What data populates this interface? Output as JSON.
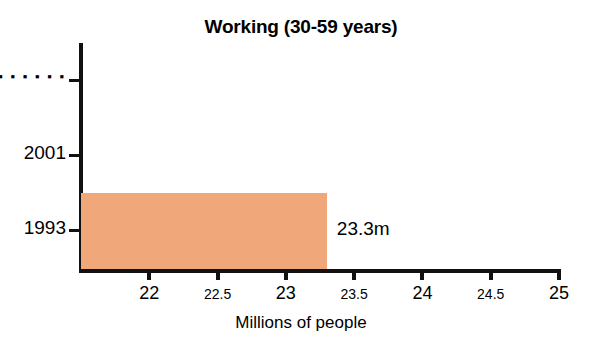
{
  "chart_data": {
    "type": "bar",
    "orientation": "horizontal",
    "title": "Working (30-59 years)",
    "xlabel": "Millions of people",
    "ylabel": "",
    "categories": [
      "1993",
      "2001",
      "……"
    ],
    "values": [
      23.3,
      null,
      null
    ],
    "value_labels": [
      "23.3m",
      "",
      ""
    ],
    "xlim": [
      21.5,
      25
    ],
    "x_axis_start": 21.5,
    "xticks": [
      22,
      22.5,
      23,
      23.5,
      24,
      24.5,
      25
    ],
    "xtick_labels": [
      "22",
      "22.5",
      "23",
      "23.5",
      "24",
      "24.5",
      "25"
    ],
    "xtick_label_sizes": [
      "major",
      "minor",
      "major",
      "minor",
      "major",
      "minor",
      "major"
    ],
    "grid": false,
    "legend": false,
    "bar_color": "#f0a87a",
    "axis_color": "#111111",
    "text_color": "#000000"
  },
  "title": {
    "text": "Working (30-59 years)"
  },
  "y_axis": {
    "ticks": [
      {
        "label": "▪ ▪ ▪ ▪ ▪ ▪",
        "is_dots": true,
        "top": 80
      },
      {
        "label": "2001",
        "is_dots": false,
        "top": 155
      },
      {
        "label": "1993",
        "is_dots": false,
        "top": 230
      }
    ]
  },
  "x_axis": {
    "title": "Millions of people",
    "ticks": [
      {
        "label": "22",
        "value": 22,
        "size": "major"
      },
      {
        "label": "22.5",
        "value": 22.5,
        "size": "minor"
      },
      {
        "label": "23",
        "value": 23,
        "size": "major"
      },
      {
        "label": "23.5",
        "value": 23.5,
        "size": "minor"
      },
      {
        "label": "24",
        "value": 24,
        "size": "major"
      },
      {
        "label": "24.5",
        "value": 24.5,
        "size": "minor"
      },
      {
        "label": "25",
        "value": 25,
        "size": "major"
      }
    ]
  },
  "bars": [
    {
      "category": "1993",
      "value": 23.3,
      "value_label": "23.3m",
      "color": "#f0a87a"
    }
  ]
}
